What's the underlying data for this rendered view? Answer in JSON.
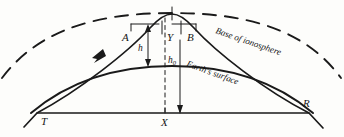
{
  "figure": {
    "background_color": "#fdfdfb",
    "ink_color": "#1a1a1a"
  },
  "labels": {
    "transmitter": "T",
    "receiver": "R",
    "ground_point": "X",
    "point_a": "A",
    "point_b": "B",
    "point_y": "Y",
    "virtual_height": "h",
    "true_height_base": "h",
    "true_height_sub": "0",
    "ionosphere_caption": "Base of ionosphere",
    "earth_caption": "Earth's surface"
  },
  "elements": {
    "ray_path": "transmitted ray from T rising to apex and descending to R",
    "direction_arrow": "arrowhead on upward ray segment",
    "ionosphere_curve": "dashed arc above",
    "earth_curve": "solid thick arc",
    "chord_baseline": "straight line from T to R",
    "center_dashed_vertical": "dashed vertical line through apex and X",
    "height_arrow_h": "double-headed vertical arrow for h",
    "height_arrow_h0": "vertical arrow for h0"
  }
}
